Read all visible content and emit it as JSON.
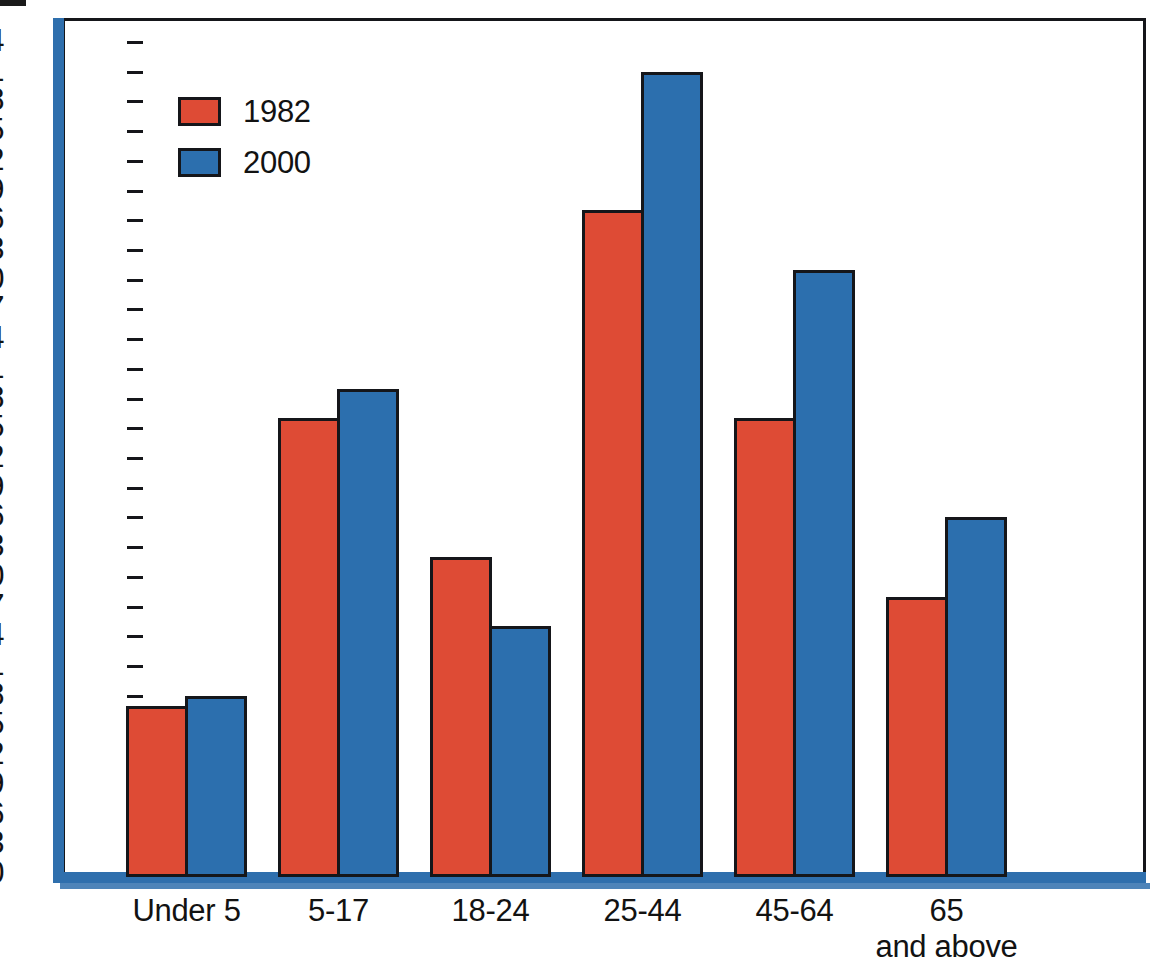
{
  "chart_data": {
    "type": "bar",
    "title": "",
    "subtitle": "",
    "xlabel": "",
    "ylabel": "",
    "categories": [
      "Under 5",
      "5-17",
      "18-24",
      "25-44",
      "45-64",
      "65\nand above"
    ],
    "series": [
      {
        "name": "1982",
        "color": "#de4b35",
        "values": [
          17,
          46,
          32,
          67,
          46,
          28
        ]
      },
      {
        "name": "2000",
        "color": "#2c6fae",
        "values": [
          18,
          49,
          25,
          81,
          61,
          36
        ]
      }
    ],
    "ylim": [
      0,
      84
    ],
    "ytick_step": 3,
    "yticks": [
      0,
      3,
      6,
      9,
      12,
      15,
      18,
      21,
      24,
      27,
      30,
      33,
      36,
      39,
      42,
      45,
      48,
      51,
      54,
      57,
      60,
      63,
      66,
      69,
      72,
      75,
      78,
      81,
      84
    ],
    "ytick_labels": [
      "0",
      "3",
      "6",
      "9",
      "12",
      "15",
      "18",
      "21",
      "24",
      "27",
      "30",
      "33",
      "36",
      "39",
      "42",
      "45",
      "48",
      "51",
      "54",
      "57",
      "60",
      "63",
      "66",
      "69",
      "72",
      "75",
      "78",
      "81",
      "84"
    ],
    "grid": false,
    "legend": {
      "position": "top-left",
      "entries": [
        "1982",
        "2000"
      ]
    },
    "axis_color": "#2f6fad",
    "frame_color": "#15161a",
    "background": "#ffffff"
  },
  "layout": {
    "plot_left": 65,
    "plot_right": 1143,
    "baseline_y": 874,
    "top_y": 42,
    "px_per_unit": 9.905,
    "group_pitch": 152,
    "group_start": 126,
    "bar_width": 62
  }
}
